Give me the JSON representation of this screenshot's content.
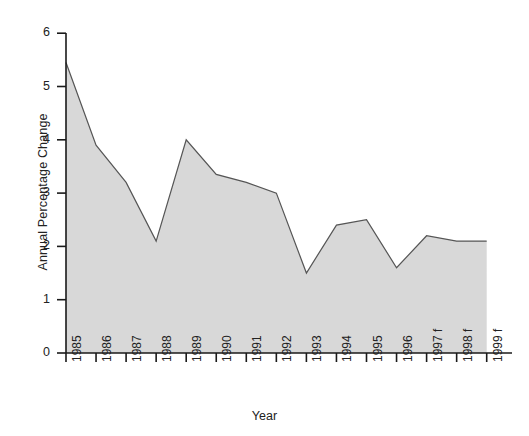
{
  "chart_data": {
    "type": "area",
    "title": "",
    "xlabel": "Year",
    "ylabel": "Annual Percentage Change",
    "categories": [
      "1985",
      "1986",
      "1987",
      "1988",
      "1989",
      "1990",
      "1991",
      "1992",
      "1993",
      "1994",
      "1995",
      "1996",
      "1997 f",
      "1998 f",
      "1999 f"
    ],
    "values": [
      5.45,
      3.9,
      3.2,
      2.1,
      4.0,
      3.35,
      3.2,
      3.0,
      1.5,
      2.4,
      2.5,
      1.6,
      2.2,
      2.1,
      2.1
    ],
    "series": [
      {
        "name": "Annual Percentage Change",
        "values": [
          5.45,
          3.9,
          3.2,
          2.1,
          4.0,
          3.35,
          3.2,
          3.0,
          1.5,
          2.4,
          2.5,
          1.6,
          2.2,
          2.1,
          2.1
        ]
      }
    ],
    "ylim": [
      0,
      6
    ],
    "yticks": [
      0,
      1,
      2,
      3,
      4,
      5,
      6
    ],
    "ytick_labels": [
      "0",
      "1",
      "2",
      "3",
      "4",
      "5",
      "6"
    ],
    "grid": false,
    "legend": "none",
    "fill_color": "#d8d8d8",
    "line_color": "#555555",
    "axis_color": "#1a1a1a",
    "background_color": "#ffffff"
  }
}
